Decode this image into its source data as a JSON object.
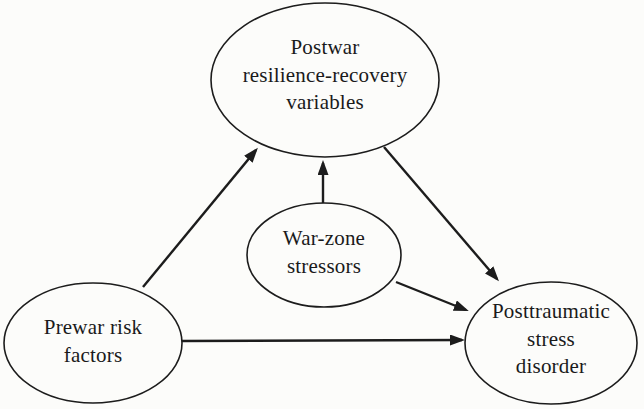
{
  "diagram": {
    "type": "path-model",
    "nodes": {
      "postwar": {
        "label": "Postwar\nresilience-recovery\nvariables"
      },
      "warzone": {
        "label": "War-zone\nstressors"
      },
      "prewar": {
        "label": "Prewar risk\nfactors"
      },
      "ptsd": {
        "label": "Posttraumatic\nstress\ndisorder"
      }
    },
    "edges": [
      {
        "from": "prewar",
        "to": "postwar"
      },
      {
        "from": "warzone",
        "to": "postwar"
      },
      {
        "from": "postwar",
        "to": "ptsd"
      },
      {
        "from": "warzone",
        "to": "ptsd"
      },
      {
        "from": "prewar",
        "to": "ptsd"
      }
    ]
  },
  "colors": {
    "line": "#1c1c1c",
    "text": "#1a1a1a",
    "background": "#fcfcfa"
  }
}
